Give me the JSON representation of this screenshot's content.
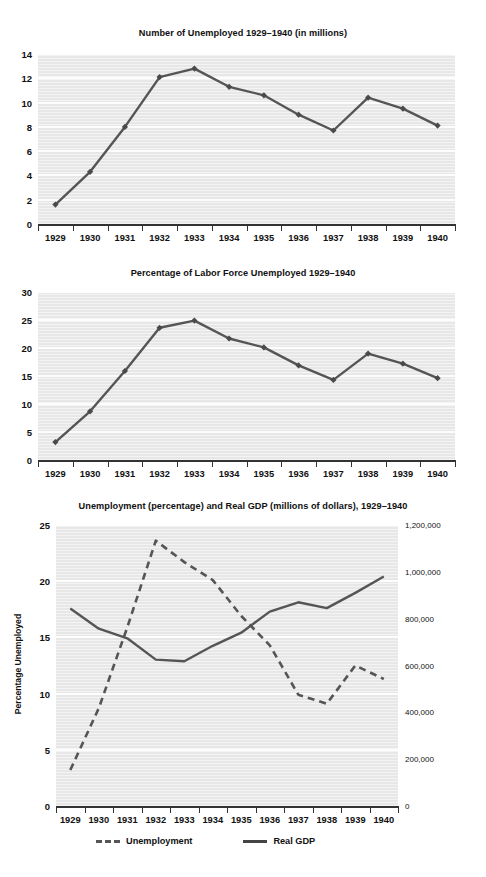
{
  "charts": [
    {
      "id": "unemployed-millions",
      "title": "Number of Unemployed 1929–1940 (in millions)",
      "yticks": [
        "0",
        "2",
        "4",
        "6",
        "8",
        "10",
        "12",
        "14"
      ],
      "xticks": [
        "1929",
        "1930",
        "1931",
        "1932",
        "1933",
        "1934",
        "1935",
        "1936",
        "1937",
        "1938",
        "1939",
        "1940"
      ]
    },
    {
      "id": "percentage-labor-force",
      "title": "Percentage of Labor Force Unemployed 1929–1940",
      "yticks": [
        "0",
        "5",
        "10",
        "15",
        "20",
        "25",
        "30"
      ],
      "xticks": [
        "1929",
        "1930",
        "1931",
        "1932",
        "1933",
        "1934",
        "1935",
        "1936",
        "1937",
        "1938",
        "1939",
        "1940"
      ]
    },
    {
      "id": "unemployment-and-gdp",
      "title": "Unemployment (percentage) and Real GDP (millions of dollars), 1929–1940",
      "ylabel_left": "Percentage Unemployed",
      "ylabel_right": "Real GDP (in millions of dollars)",
      "yticks_left": [
        "0",
        "5",
        "10",
        "15",
        "20",
        "25"
      ],
      "yticks_right": [
        "0",
        "200,000",
        "400,000",
        "600,000",
        "800,000",
        "1,000,000",
        "1,200,000"
      ],
      "xticks": [
        "1929",
        "1930",
        "1931",
        "1932",
        "1933",
        "1934",
        "1935",
        "1936",
        "1937",
        "1938",
        "1939",
        "1940"
      ],
      "legend": [
        {
          "label": "Unemployment",
          "style": "dashed"
        },
        {
          "label": "Real GDP",
          "style": "solid"
        }
      ]
    }
  ],
  "colors": {
    "plot_background": "#e7e7e7",
    "gridline": "#fdfdfd",
    "line": "#555555",
    "marker": "#4a4a4a",
    "axis": "#333333",
    "text": "#111111"
  },
  "chart_data": [
    {
      "type": "line",
      "title": "Number of Unemployed 1929–1940 (in millions)",
      "xlabel": "",
      "ylabel": "",
      "categories": [
        "1929",
        "1930",
        "1931",
        "1932",
        "1933",
        "1934",
        "1935",
        "1936",
        "1937",
        "1938",
        "1939",
        "1940"
      ],
      "values": [
        1.6,
        4.3,
        8.0,
        12.1,
        12.8,
        11.3,
        10.6,
        9.0,
        7.7,
        10.4,
        9.5,
        8.1
      ],
      "ylim": [
        0,
        14
      ],
      "yticks": [
        0,
        2,
        4,
        6,
        8,
        10,
        12,
        14
      ],
      "grid": true,
      "legend": "none",
      "markers": true
    },
    {
      "type": "line",
      "title": "Percentage of Labor Force Unemployed 1929–1940",
      "xlabel": "",
      "ylabel": "",
      "categories": [
        "1929",
        "1930",
        "1931",
        "1932",
        "1933",
        "1934",
        "1935",
        "1936",
        "1937",
        "1938",
        "1939",
        "1940"
      ],
      "values": [
        3.2,
        8.7,
        15.9,
        23.6,
        24.9,
        21.7,
        20.1,
        16.9,
        14.3,
        19.0,
        17.2,
        14.6
      ],
      "ylim": [
        0,
        30
      ],
      "yticks": [
        0,
        5,
        10,
        15,
        20,
        25,
        30
      ],
      "grid": true,
      "legend": "none",
      "markers": true
    },
    {
      "type": "line",
      "title": "Unemployment (percentage) and Real GDP (millions of dollars), 1929–1940",
      "xlabel": "",
      "ylabel": "Percentage Unemployed",
      "ylabel2": "Real GDP (in millions of dollars)",
      "categories": [
        "1929",
        "1930",
        "1931",
        "1932",
        "1933",
        "1934",
        "1935",
        "1936",
        "1937",
        "1938",
        "1939",
        "1940"
      ],
      "series": [
        {
          "name": "Unemployment",
          "axis": "left",
          "style": "dashed",
          "values": [
            3.2,
            8.7,
            15.9,
            23.6,
            21.7,
            20.1,
            16.9,
            14.3,
            9.9,
            9.1,
            12.5,
            11.3
          ]
        },
        {
          "name": "Real GDP",
          "axis": "right",
          "style": "solid",
          "values": [
            843000,
            757000,
            716000,
            625000,
            618000,
            684000,
            740000,
            830000,
            870000,
            845000,
            910000,
            980000
          ]
        }
      ],
      "ylim": [
        0,
        25
      ],
      "yticks": [
        0,
        5,
        10,
        15,
        20,
        25
      ],
      "ylim2": [
        0,
        1200000
      ],
      "yticks2": [
        0,
        200000,
        400000,
        600000,
        800000,
        1000000,
        1200000
      ],
      "grid": true,
      "legend": "bottom",
      "markers": false
    }
  ]
}
